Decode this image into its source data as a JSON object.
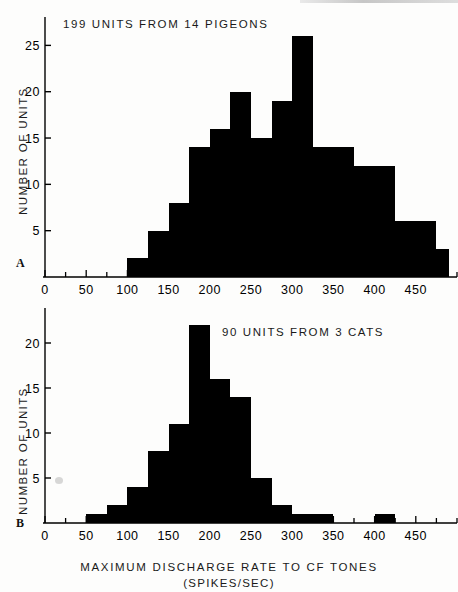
{
  "figure": {
    "background_color": "#fdfdfc",
    "ink_color": "#000000",
    "xlabel_main": "MAXIMUM  DISCHARGE  RATE  TO  CF  TONES",
    "xlabel_sub": "(SPIKES/SEC)"
  },
  "panel_a": {
    "letter": "A",
    "title": "199 UNITS FROM 14 PIGEONS",
    "ylabel": "NUMBER  OF  UNITS"
  },
  "panel_b": {
    "letter": "B",
    "title": "90 UNITS FROM 3 CATS",
    "ylabel": "NUMBER  OF  UNITS"
  },
  "chart_data": [
    {
      "type": "bar",
      "id": "panel-a",
      "title": "199 UNITS FROM 14 PIGEONS",
      "xlabel": "MAXIMUM DISCHARGE RATE TO CF TONES (SPIKES/SEC)",
      "ylabel": "NUMBER OF UNITS",
      "bin_width": 25,
      "xlim": [
        0,
        500
      ],
      "ylim": [
        0,
        27
      ],
      "xticks": [
        0,
        50,
        100,
        150,
        200,
        250,
        300,
        350,
        400,
        450
      ],
      "xtick_labels": [
        "0",
        "50",
        "100",
        "150",
        "200",
        "250",
        "300",
        "350",
        "400",
        "450"
      ],
      "minor_xtick_step": 25,
      "yticks": [
        5,
        10,
        15,
        20,
        25
      ],
      "ytick_labels": [
        "5",
        "10",
        "15",
        "20",
        "25"
      ],
      "grid": false,
      "legend": false,
      "bin_starts": [
        100,
        125,
        150,
        175,
        200,
        225,
        250,
        275,
        300,
        325,
        350,
        375,
        400,
        425,
        450,
        475
      ],
      "values": [
        2,
        5,
        8,
        14,
        16,
        20,
        15,
        19,
        26,
        14,
        14,
        12,
        12,
        6,
        6,
        3
      ],
      "categories": [
        "100-125",
        "125-150",
        "150-175",
        "175-200",
        "200-225",
        "225-250",
        "250-275",
        "275-300",
        "300-325",
        "325-350",
        "350-375",
        "375-400",
        "400-425",
        "425-450",
        "450-475",
        "475-490"
      ],
      "total_units": 199,
      "n_animals": 14,
      "species": "PIGEONS"
    },
    {
      "type": "bar",
      "id": "panel-b",
      "title": "90 UNITS FROM 3 CATS",
      "xlabel": "MAXIMUM DISCHARGE RATE TO CF TONES (SPIKES/SEC)",
      "ylabel": "NUMBER OF UNITS",
      "bin_width": 25,
      "xlim": [
        0,
        500
      ],
      "ylim": [
        0,
        23
      ],
      "xticks": [
        0,
        50,
        100,
        150,
        200,
        250,
        300,
        350,
        400,
        450
      ],
      "xtick_labels": [
        "0",
        "50",
        "100",
        "150",
        "200",
        "250",
        "300",
        "350",
        "400",
        "450"
      ],
      "minor_xtick_step": 25,
      "yticks": [
        5,
        10,
        15,
        20
      ],
      "ytick_labels": [
        "5",
        "10",
        "15",
        "20"
      ],
      "grid": false,
      "legend": false,
      "bin_starts": [
        50,
        75,
        100,
        125,
        150,
        175,
        200,
        225,
        250,
        275,
        300,
        325,
        400
      ],
      "values": [
        1,
        2,
        4,
        8,
        11,
        22,
        16,
        14,
        5,
        2,
        1,
        1,
        1
      ],
      "categories": [
        "50-75",
        "75-100",
        "100-125",
        "125-150",
        "150-175",
        "175-200",
        "200-225",
        "225-250",
        "250-275",
        "275-300",
        "300-325",
        "325-350",
        "400-425"
      ],
      "total_units": 90,
      "n_animals": 3,
      "species": "CATS"
    }
  ]
}
